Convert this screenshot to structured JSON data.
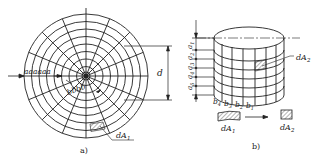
{
  "figure_a": {
    "caption": "a)",
    "dimension_label": "d",
    "radial_labels": "aaaaaa",
    "arc_labels": "bbbb",
    "element_label": "dA",
    "element_sub": "1"
  },
  "figure_b": {
    "caption": "b)",
    "height_labels": [
      "a",
      "a",
      "a",
      "a",
      "a"
    ],
    "height_subs": [
      "1",
      "2",
      "3",
      "4",
      "5"
    ],
    "width_labels": [
      "b",
      "b",
      "b",
      "b"
    ],
    "width_subs": [
      "4",
      "3",
      "2",
      "1"
    ],
    "element_label_cyl": "dA",
    "element_sub_cyl": "2",
    "transform_from_label": "dA",
    "transform_from_sub": "1",
    "transform_to_label": "dA",
    "transform_to_sub": "2"
  },
  "colors": {
    "line": "#222222",
    "hatch": "#444444"
  }
}
